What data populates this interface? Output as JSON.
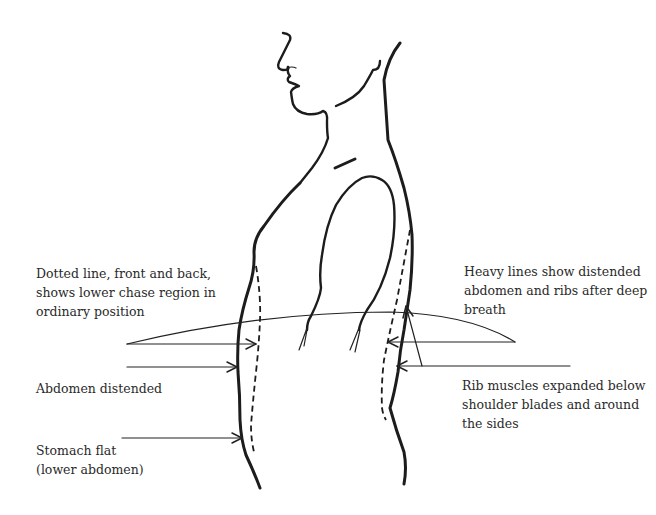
{
  "figure": {
    "colors": {
      "background": "#ffffff",
      "ink": "#1c1c1c",
      "text": "#2a2a2a"
    }
  },
  "labels": {
    "dotted_line": {
      "lines": [
        "Dotted line, front and back,",
        "shows lower chase region in",
        "ordinary position"
      ]
    },
    "heavy_lines": {
      "lines": [
        "Heavy lines show distended",
        "abdomen and ribs after deep",
        "breath"
      ]
    },
    "abdomen_distended": {
      "lines": [
        "Abdomen distended"
      ]
    },
    "rib_muscles": {
      "lines": [
        "Rib muscles expanded below",
        "shoulder blades and around",
        "the sides"
      ]
    },
    "stomach_flat": {
      "lines": [
        "Stomach flat",
        "(lower abdomen)"
      ]
    }
  }
}
